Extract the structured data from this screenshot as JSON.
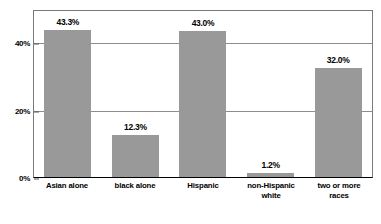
{
  "chart_data": {
    "type": "bar",
    "title": "",
    "subtitle": "",
    "xlabel": "",
    "ylabel": "",
    "categories": [
      "Asian alone",
      "black alone",
      "Hispanic",
      "non-Hispanic white",
      "two or more races"
    ],
    "category_lines": [
      [
        "Asian alone",
        ""
      ],
      [
        "black alone",
        ""
      ],
      [
        "Hispanic",
        ""
      ],
      [
        "non-Hispanic",
        "white"
      ],
      [
        "two or more",
        "races"
      ]
    ],
    "values": [
      43.3,
      12.3,
      43.0,
      1.2,
      32.0
    ],
    "value_labels": [
      "43.3%",
      "12.3%",
      "43.0%",
      "1.2%",
      "32.0%"
    ],
    "ylim": [
      0,
      49.1
    ],
    "yticks": [
      0,
      20,
      40
    ],
    "ytick_labels": [
      "0%",
      "20%",
      "40%"
    ],
    "grid": true,
    "legend": null,
    "bar_color": "#999999",
    "axis_color": "#000000",
    "gridline_color": "#8d8d8d",
    "text_color": "#000000",
    "background": "#ffffff"
  },
  "axis": {
    "y": {
      "tick_0": "0%",
      "tick_20": "20%",
      "tick_40": "40%"
    }
  },
  "bars": [
    {
      "label_line1": "Asian alone",
      "label_line2": "",
      "value_label": "43.3%",
      "value": 43.3
    },
    {
      "label_line1": "black alone",
      "label_line2": "",
      "value_label": "12.3%",
      "value": 12.3
    },
    {
      "label_line1": "Hispanic",
      "label_line2": "",
      "value_label": "43.0%",
      "value": 43.0
    },
    {
      "label_line1": "non-Hispanic",
      "label_line2": "white",
      "value_label": "1.2%",
      "value": 1.2
    },
    {
      "label_line1": "two or more",
      "label_line2": "races",
      "value_label": "32.0%",
      "value": 32.0
    }
  ]
}
